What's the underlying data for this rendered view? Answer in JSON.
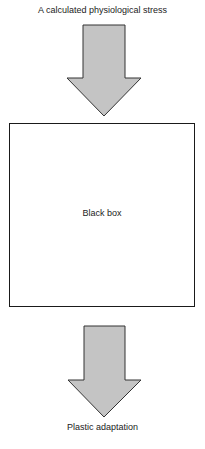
{
  "diagram": {
    "input_label": "A calculated physiological stress",
    "box_label": "Black box",
    "output_label": "Plastic adaptation",
    "colors": {
      "arrow_fill": "#c4c4c4",
      "arrow_stroke": "#333333",
      "box_border": "#1a1a1a"
    }
  }
}
